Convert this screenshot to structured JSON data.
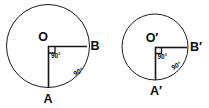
{
  "figure": {
    "background_color": "#ffffff",
    "stroke_color": "#1b1b1b",
    "text_color": "#0d0d0d",
    "shapes": [
      {
        "id": "left",
        "center_label": "O",
        "point_bottom_label": "A",
        "point_right_label": "B",
        "central_angle_label": "90°",
        "arc_angle_label": "90°",
        "center_x": 48,
        "center_y": 46,
        "radius": 42
      },
      {
        "id": "right",
        "center_label": "O′",
        "point_bottom_label": "A′",
        "point_right_label": "B′",
        "central_angle_label": "90°",
        "arc_angle_label": "90°",
        "center_x": 155,
        "center_y": 47,
        "radius": 33
      }
    ]
  },
  "left_circle": {
    "center_label": "O",
    "bottom_point_label": "A",
    "right_point_label": "B",
    "central_angle": "90°",
    "arc_angle": "90°"
  },
  "right_circle": {
    "center_label": "O′",
    "bottom_point_label": "A′",
    "right_point_label": "B′",
    "central_angle": "90°",
    "arc_angle": "90°"
  }
}
